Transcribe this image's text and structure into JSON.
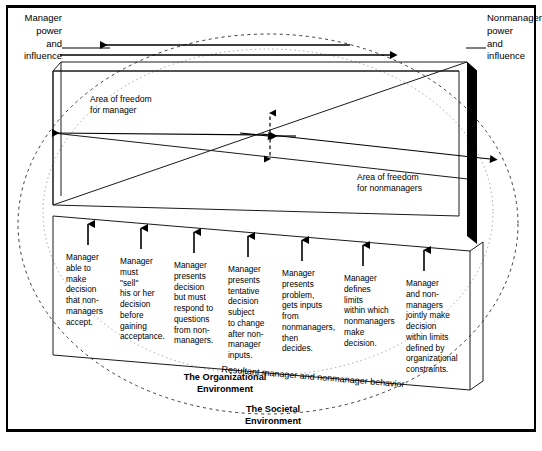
{
  "diagram": {
    "axis_labels": {
      "left": "Manager\npower\nand\ninfluence",
      "right": "Nonmanager\npower\nand\ninfluence"
    },
    "area_labels": {
      "manager": "Area of freedom\nfor manager",
      "nonmanager": "Area of freedom\nfor nonmanagers"
    },
    "resultant": "Resultant manager and nonmanager behavior",
    "environments": {
      "organizational": "The Organizational\nEnvironment",
      "societal": "The Societal\nEnvironment"
    },
    "behaviors": [
      "Manager\nable to\nmake\ndecision\nthat non-\nmanagers\naccept.",
      "Manager\nmust\n\"sell\"\nhis or her\ndecision\nbefore\ngaining\nacceptance.",
      "Manager\npresents\ndecision\nbut must\nrespond to\nquestions\nfrom non-\nmanagers.",
      "Manager\npresents\ntentative\ndecision\nsubject\nto change\nafter non-\nmanager\ninputs.",
      "Manager\npresents\nproblem,\ngets inputs\nfrom\nnonmanagers,\nthen\ndecides.",
      "Manager\ndefines\nlimits\nwithin which\nnonmanagers\nmake\ndecision.",
      "Manager\nand non-\nmanagers\njointly make\ndecision\nwithin limits\ndefined by\norganizational\nconstraints."
    ],
    "colors": {
      "ink": "#000000",
      "line": "#1a1a1a",
      "societal_ellipse": "#3a3a3a",
      "organizational_ellipse": "#9a9a9a",
      "solid_bar": "#000000",
      "background": "#ffffff"
    }
  }
}
